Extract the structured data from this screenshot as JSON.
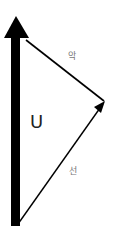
{
  "diagram": {
    "type": "vector-triangle",
    "labels": {
      "main_vector": "U",
      "upper_edge": "악",
      "lower_edge": "선"
    },
    "colors": {
      "stroke": "#000000",
      "label_small": "#777777",
      "label_big": "#222222",
      "background": "#ffffff"
    }
  }
}
